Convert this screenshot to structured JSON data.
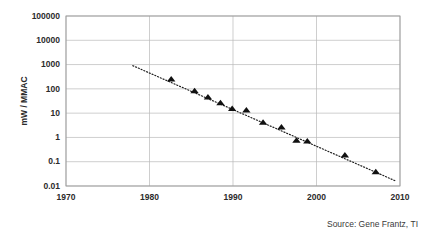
{
  "chart_data": {
    "type": "scatter",
    "title": "",
    "xlabel": "",
    "ylabel": "mW / MMAC",
    "xlim": [
      1970,
      2010
    ],
    "ylim": [
      0.01,
      100000
    ],
    "yscale": "log",
    "grid": true,
    "legend": "none",
    "x_ticks": [
      "1970",
      "1980",
      "1990",
      "2000",
      "2010"
    ],
    "x_tick_values": [
      1970,
      1980,
      1990,
      2000,
      2010
    ],
    "y_ticks": [
      "100000",
      "10000",
      "1000",
      "100",
      "10",
      "1",
      "0.1",
      "0.01"
    ],
    "y_tick_values": [
      100000,
      10000,
      1000,
      100,
      10,
      1,
      0.1,
      0.01
    ],
    "series": [
      {
        "name": "mW per MMAC",
        "marker": "triangle",
        "color": "#111111",
        "x": [
          1982.6,
          1985.4,
          1987.0,
          1988.5,
          1989.9,
          1991.6,
          1993.6,
          1995.8,
          1997.6,
          1998.9,
          2003.4,
          2007.1
        ],
        "y": [
          260,
          85,
          47,
          27,
          15.5,
          13.5,
          4.3,
          2.7,
          0.78,
          0.72,
          0.19,
          0.039
        ]
      }
    ],
    "trendline": {
      "name": "log-linear fit",
      "style": "dotted",
      "color": "#1a1a1a",
      "x_start": 1978.0,
      "y_start": 900,
      "x_end": 2009.5,
      "y_end": 0.016
    },
    "annotations": [
      {
        "name": "source-note",
        "text": "Source: Gene Frantz, TI"
      }
    ]
  },
  "source": {
    "text": "Source: Gene Frantz, TI"
  },
  "axes": {
    "y_title": "mW / MMAC"
  }
}
